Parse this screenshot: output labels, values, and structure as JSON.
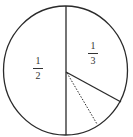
{
  "diagram": {
    "type": "circle-fraction",
    "stroke_color": "#2a2a2a",
    "regions": [
      {
        "name": "left-half",
        "label_num": "1",
        "label_den": "2"
      },
      {
        "name": "upper-right-third",
        "label_num": "1",
        "label_den": "3"
      },
      {
        "name": "lower-right-remainder",
        "label_num": "",
        "label_den": ""
      }
    ],
    "lines": {
      "vertical_diameter": {
        "style": "solid"
      },
      "third_radius": {
        "style": "solid"
      },
      "split_radius": {
        "style": "dotted"
      }
    }
  }
}
